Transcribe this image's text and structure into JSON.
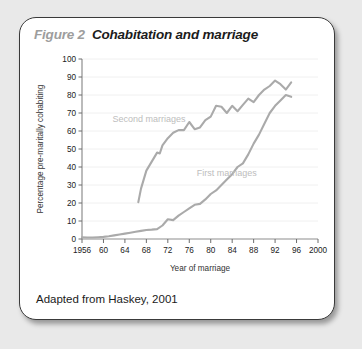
{
  "figure": {
    "number_label": "Figure 2",
    "title": "Cohabitation and marriage",
    "caption": "Adapted from Haskey, 2001"
  },
  "colors": {
    "page_background": "#e9e9e9",
    "card_background": "#ffffff",
    "card_border": "#3a3a3a",
    "title_number": "#9d9d9d",
    "title_text": "#1b1b1b",
    "line": "#aaaaaa",
    "series_label": "#bdbdbd",
    "gridline": "#f0f0f0",
    "axis": "#8e8e8e"
  },
  "chart_data": {
    "type": "line",
    "title": "Cohabitation and marriage",
    "xlabel": "Year of marriage",
    "ylabel": "Percentage pre-maritally cohabiting",
    "xlim": [
      1956,
      2000
    ],
    "ylim": [
      0,
      100
    ],
    "xticks": [
      1956,
      1960,
      1964,
      1968,
      1972,
      1976,
      1980,
      1984,
      1988,
      1992,
      1996,
      2000
    ],
    "xticklabels": [
      "1956",
      "60",
      "64",
      "68",
      "72",
      "76",
      "80",
      "84",
      "88",
      "92",
      "96",
      "2000"
    ],
    "yticks": [
      0,
      10,
      20,
      30,
      40,
      50,
      60,
      70,
      80,
      90,
      100
    ],
    "yticklabels": [
      "0",
      "10",
      "20",
      "30",
      "40",
      "50",
      "60",
      "70",
      "80",
      "90",
      "100"
    ],
    "grid": "horizontal",
    "legend_position": "inline-annotations",
    "series": [
      {
        "name": "Second marriages",
        "label_x": 1968.5,
        "label_y": 65,
        "x": [
          1966.5,
          1967,
          1968,
          1969,
          1970,
          1970.5,
          1971,
          1972,
          1973,
          1974,
          1975,
          1976,
          1977,
          1978,
          1979,
          1980,
          1981,
          1982,
          1983,
          1984,
          1985,
          1986,
          1987,
          1988,
          1989,
          1990,
          1991,
          1992,
          1993,
          1994,
          1995
        ],
        "y": [
          20.5,
          28,
          38,
          43,
          48,
          47.5,
          52,
          56,
          59,
          60.5,
          60.5,
          65,
          61,
          62,
          66,
          68,
          74,
          73.5,
          70,
          74,
          71,
          74.5,
          78,
          76,
          80,
          83,
          85,
          88,
          86,
          83,
          87
        ]
      },
      {
        "name": "First marriages",
        "label_x": 1983,
        "label_y": 35,
        "x": [
          1956,
          1957,
          1958,
          1959,
          1960,
          1961,
          1962,
          1963,
          1964,
          1965,
          1966,
          1967,
          1968,
          1969,
          1970,
          1971,
          1972,
          1973,
          1974,
          1975,
          1976,
          1977,
          1978,
          1979,
          1980,
          1981,
          1982,
          1983,
          1984,
          1985,
          1986,
          1987,
          1988,
          1989,
          1990,
          1991,
          1992,
          1993,
          1994,
          1995
        ],
        "y": [
          1,
          0.8,
          0.8,
          1,
          1.2,
          1.5,
          2,
          2.5,
          3,
          3.5,
          4,
          4.5,
          5,
          5.2,
          5.5,
          7.5,
          11,
          10.5,
          13,
          15,
          17,
          19,
          19.5,
          22,
          25,
          27,
          30,
          33,
          36,
          40,
          42,
          47,
          53,
          58,
          64,
          70,
          74,
          77,
          80,
          79
        ]
      }
    ]
  }
}
